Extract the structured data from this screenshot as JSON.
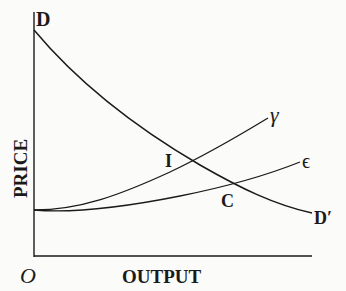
{
  "diagram": {
    "axes": {
      "y_label": "PRICE",
      "x_label": "OUTPUT",
      "origin_label": "O"
    },
    "curves": [
      {
        "id": "demand",
        "start_label": "D",
        "end_label": "D′"
      },
      {
        "id": "gamma",
        "end_label": "γ"
      },
      {
        "id": "epsilon",
        "end_label": "ϵ"
      }
    ],
    "points": [
      {
        "id": "I",
        "label": "I"
      },
      {
        "id": "C",
        "label": "C"
      }
    ],
    "colors": {
      "ink": "#1a1a1a",
      "paper": "#fbfbf9"
    }
  }
}
